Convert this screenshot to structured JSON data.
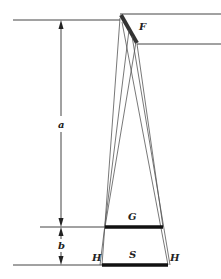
{
  "diagram": {
    "labels": {
      "mirror": "F",
      "distance_a": "a",
      "distance_b": "b",
      "upper_plane": "G",
      "lower_plane": "S",
      "edge_left": "H",
      "edge_right": "H"
    },
    "colors": {
      "line": "#444444",
      "thick": "#111111",
      "background": "#ffffff"
    }
  }
}
